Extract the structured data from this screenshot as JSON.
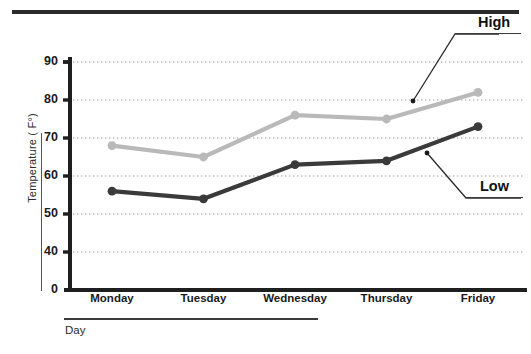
{
  "chart_data": {
    "type": "line",
    "title": "",
    "xlabel": "Day",
    "ylabel": "Temperature ( F°)",
    "categories": [
      "Monday",
      "Tuesday",
      "Wednesday",
      "Thursday",
      "Friday"
    ],
    "ylim": [
      0,
      90
    ],
    "yticks": [
      0,
      40,
      50,
      60,
      70,
      80,
      90
    ],
    "ytick_labels": [
      "0",
      "40",
      "50",
      "60",
      "70",
      "80",
      "90"
    ],
    "y_axis_note": "broken axis: gap between 0 and 40",
    "grid": true,
    "grid_style": "dotted-horizontal",
    "legend": "inline-leader-labels",
    "series": [
      {
        "name": "High",
        "color": "#b9b9b9",
        "marker": "circle",
        "values": [
          68,
          65,
          76,
          75,
          82
        ]
      },
      {
        "name": "Low",
        "color": "#3a3a3a",
        "marker": "circle",
        "values": [
          56,
          54,
          63,
          64,
          73
        ]
      }
    ],
    "annotations": [
      {
        "text": "High",
        "target_series": "High",
        "target_category": "Friday"
      },
      {
        "text": "Low",
        "target_series": "Low",
        "target_category": "Friday"
      }
    ]
  },
  "colors": {
    "high_series": "#b9b9b9",
    "low_series": "#3a3a3a",
    "axis": "#1f1f1f",
    "grid": "#9a9a9a",
    "background": "#ffffff"
  }
}
